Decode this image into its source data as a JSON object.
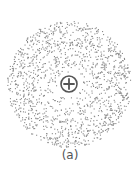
{
  "figure": {
    "caption": "(a)",
    "nucleus_symbol": "+",
    "nucleus": {
      "cx": 69,
      "cy": 84,
      "r": 8
    },
    "cloud": {
      "cx": 69,
      "cy": 84,
      "r": 62,
      "inner_r": 11,
      "dot_count": 1400,
      "dot_color": "#8a8a8a"
    },
    "stroke_color": "#555555"
  }
}
